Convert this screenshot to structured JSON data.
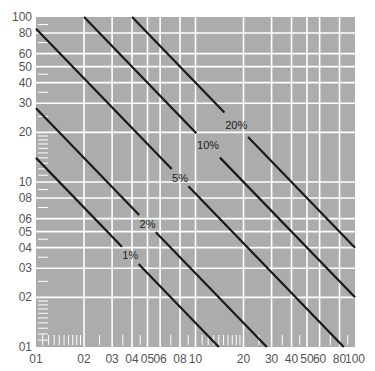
{
  "chart_data": {
    "type": "line",
    "scale": "log-log",
    "title": "",
    "xlabel": "",
    "ylabel": "",
    "xlim": [
      1,
      100
    ],
    "ylim": [
      1,
      100
    ],
    "grid": true,
    "legend": "inline labels on lines",
    "x_tick_labels": [
      "01",
      "02",
      "03",
      "04",
      "05",
      "06",
      "08",
      "10",
      "20",
      "30",
      "40",
      "50",
      "60",
      "80",
      "100"
    ],
    "x_tick_values": [
      1,
      2,
      3,
      4,
      5,
      6,
      8,
      10,
      20,
      30,
      40,
      50,
      60,
      80,
      100
    ],
    "y_tick_labels": [
      "01",
      "02",
      "03",
      "04",
      "05",
      "06",
      "08",
      "10",
      "20",
      "30",
      "40",
      "50",
      "60",
      "80",
      "100"
    ],
    "y_tick_values": [
      1,
      2,
      3,
      4,
      5,
      6,
      8,
      10,
      20,
      30,
      40,
      50,
      60,
      80,
      100
    ],
    "series": [
      {
        "name": "1%",
        "k": 14,
        "x": [
          1,
          14
        ],
        "y": [
          14,
          1
        ]
      },
      {
        "name": "2%",
        "k": 28,
        "x": [
          1,
          28
        ],
        "y": [
          28,
          1
        ]
      },
      {
        "name": "5%",
        "k": 85,
        "x": [
          1,
          85
        ],
        "y": [
          85,
          1
        ]
      },
      {
        "name": "10%",
        "k": 200,
        "x": [
          2,
          100
        ],
        "y": [
          100,
          2
        ]
      },
      {
        "name": "20%",
        "k": 400,
        "x": [
          4,
          100
        ],
        "y": [
          100,
          4
        ]
      }
    ],
    "label_positions": [
      {
        "name": "1%",
        "x": 3.9,
        "y": 3.6
      },
      {
        "name": "2%",
        "x": 5.0,
        "y": 5.4
      },
      {
        "name": "5%",
        "x": 8.0,
        "y": 9.0
      },
      {
        "name": "10%",
        "x": 12.0,
        "y": 14.5
      },
      {
        "name": "20%",
        "x": 18.0,
        "y": 22.0
      }
    ]
  },
  "colors": {
    "background": "#acacac",
    "grid": "#ffffff",
    "line": "#1a1a1a",
    "text": "#555555"
  }
}
